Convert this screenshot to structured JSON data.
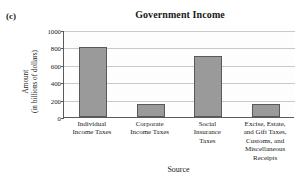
{
  "panel": {
    "label": "(c)"
  },
  "chart_data": {
    "type": "bar",
    "title": "Government Income",
    "xlabel": "Source",
    "ylabel": "Amount (in billions of dollars)",
    "ylabel_line1": "Amount",
    "ylabel_line2": "(in billions of dollars)",
    "categories": [
      "Individual Income Taxes",
      "Corporate Income Taxes",
      "Social Insurance Taxes",
      "Excise, Estate, and Gift Taxes, Customs, and Miscellaneous Receipts"
    ],
    "category_lines": [
      [
        "Individual",
        "Income Taxes"
      ],
      [
        "Corporate",
        "Income Taxes"
      ],
      [
        "Social",
        "Insurance",
        "Taxes"
      ],
      [
        "Excise, Estate,",
        "and Gift Taxes,",
        "Customs, and",
        "Miscellaneous",
        "Receipts"
      ]
    ],
    "values": [
      800,
      145,
      700,
      145
    ],
    "ylim": [
      0,
      1000
    ],
    "yticks": [
      0,
      200,
      400,
      600,
      800,
      1000
    ],
    "ytick_labels": [
      "0",
      "200",
      "400",
      "600",
      "800",
      "1000"
    ],
    "grid": true,
    "legend": "none",
    "bar_color": "#9a9a9a",
    "bar_edge_color": "#595959",
    "gridline_color": "#c9c9c9",
    "axis_color": "#5a5a5a"
  }
}
